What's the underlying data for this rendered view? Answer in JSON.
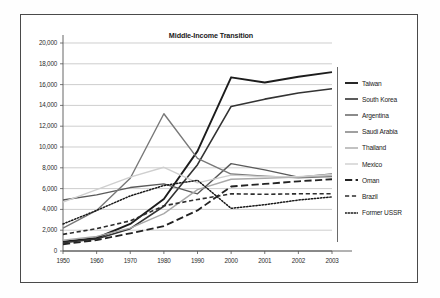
{
  "chart_data": {
    "type": "line",
    "title": "Middle-Income Transition",
    "xlabel": "",
    "ylabel": "",
    "x": [
      "1950",
      "1960",
      "1970",
      "1980",
      "1990",
      "2000",
      "2001",
      "2002",
      "2003"
    ],
    "ylim": [
      0,
      20000
    ],
    "yticks": [
      0,
      2000,
      4000,
      6000,
      8000,
      10000,
      12000,
      14000,
      16000,
      18000,
      20000
    ],
    "ytick_labels": [
      "0",
      "2,000",
      "4,000",
      "6,000",
      "8,000",
      "10,000",
      "12,000",
      "14,000",
      "16,000",
      "18,000",
      "20,000"
    ],
    "grid": "horizontal",
    "legend_position": "right",
    "series": [
      {
        "name": "Taiwan",
        "color": "#1c1c1c",
        "style": "solid",
        "width": 1.9,
        "values": [
          900,
          1250,
          2600,
          5000,
          9600,
          16700,
          16200,
          16750,
          17200
        ]
      },
      {
        "name": "South Korea",
        "color": "#333333",
        "style": "solid",
        "width": 1.6,
        "values": [
          800,
          1150,
          2150,
          4300,
          8300,
          13900,
          14600,
          15200,
          15600
        ]
      },
      {
        "name": "Argentina",
        "color": "#5a5a5a",
        "style": "solid",
        "width": 1.4,
        "values": [
          4900,
          5400,
          6100,
          6450,
          5500,
          8400,
          7800,
          7100,
          7400
        ]
      },
      {
        "name": "Saudi Arabia",
        "color": "#787878",
        "style": "solid",
        "width": 1.4,
        "values": [
          2200,
          3900,
          7000,
          13200,
          8900,
          7400,
          7200,
          7050,
          7150
        ]
      },
      {
        "name": "Thailand",
        "color": "#a8a8a8",
        "style": "solid",
        "width": 1.4,
        "values": [
          1050,
          1400,
          2200,
          3600,
          5900,
          6900,
          7000,
          7100,
          7300
        ]
      },
      {
        "name": "Mexico",
        "color": "#cfcfcf",
        "style": "solid",
        "width": 1.4,
        "values": [
          4700,
          5900,
          7100,
          8050,
          6550,
          7300,
          7150,
          7150,
          7350
        ]
      },
      {
        "name": "Oman",
        "color": "#232323",
        "style": "long-dash",
        "width": 1.8,
        "values": [
          650,
          1050,
          1700,
          2400,
          3900,
          6200,
          6450,
          6700,
          6900
        ]
      },
      {
        "name": "Brazil",
        "color": "#2e2e2e",
        "style": "dash",
        "width": 1.6,
        "values": [
          1600,
          2150,
          2900,
          4350,
          4950,
          5500,
          5450,
          5500,
          5500
        ]
      },
      {
        "name": "Former USSR",
        "color": "#1a1a1a",
        "style": "dotted",
        "width": 1.5,
        "values": [
          2600,
          3900,
          5300,
          6300,
          6800,
          4100,
          4450,
          4900,
          5200
        ]
      }
    ]
  }
}
